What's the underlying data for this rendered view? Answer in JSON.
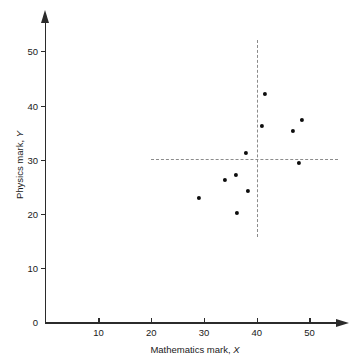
{
  "chart_data": {
    "type": "scatter",
    "title": "",
    "xlabel": "Mathematics mark, X",
    "ylabel": "Physics mark, Y",
    "xlabel_text": "Mathematics mark,",
    "xlabel_sym": "X",
    "ylabel_text": "Physics mark,",
    "ylabel_sym": "Y",
    "xlim": [
      0,
      56
    ],
    "ylim": [
      0,
      55
    ],
    "xticks": [
      10,
      20,
      30,
      40,
      50
    ],
    "xticklabels": [
      "10",
      "20",
      "30",
      "40",
      "50"
    ],
    "yticks": [
      0,
      10,
      20,
      30,
      40,
      50
    ],
    "yticklabels": [
      "0",
      "10",
      "20",
      "30",
      "40",
      "50"
    ],
    "grid": false,
    "legend": false,
    "marker": "filled-circle",
    "marker_color": "#0d0d0d",
    "axis_color": "#2b2b2b",
    "reference_line_color": "#8c8c8c",
    "points": [
      {
        "x": 29.0,
        "y": 23.0
      },
      {
        "x": 33.9,
        "y": 26.2
      },
      {
        "x": 36.0,
        "y": 27.2
      },
      {
        "x": 36.3,
        "y": 20.2
      },
      {
        "x": 37.9,
        "y": 31.2
      },
      {
        "x": 38.4,
        "y": 24.2
      },
      {
        "x": 41.0,
        "y": 36.3
      },
      {
        "x": 41.6,
        "y": 42.2
      },
      {
        "x": 46.8,
        "y": 35.3
      },
      {
        "x": 48.0,
        "y": 29.4
      },
      {
        "x": 48.5,
        "y": 37.3
      }
    ],
    "reference_lines": [
      {
        "orientation": "horizontal",
        "value": 30.2,
        "from": 20.0,
        "to": 55.5,
        "style": "dashed"
      },
      {
        "orientation": "vertical",
        "value": 40.0,
        "from": 15.7,
        "to": 52.0,
        "style": "dashed"
      }
    ]
  }
}
